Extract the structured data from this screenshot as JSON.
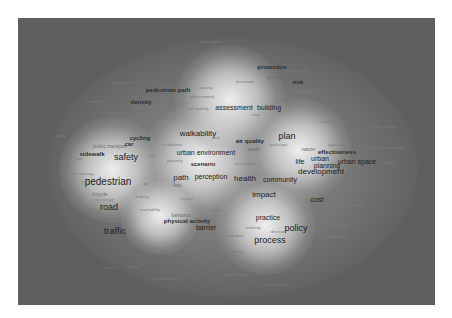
{
  "visualization": {
    "type": "term density map",
    "colors": {
      "background": "#ffffff",
      "low_density": "#5f5f5f",
      "high_density": "#f2f2f2",
      "text": "#222222"
    },
    "terms": [
      {
        "label": "urban growth",
        "x": 211,
        "y": 42,
        "size": 0
      },
      {
        "label": "protection",
        "x": 272,
        "y": 67,
        "size": 2
      },
      {
        "label": "exposure",
        "x": 298,
        "y": 71,
        "size": 0
      },
      {
        "label": "green infrastructure",
        "x": 289,
        "y": 77,
        "size": 1
      },
      {
        "label": "risk",
        "x": 298,
        "y": 82,
        "size": 2
      },
      {
        "label": "prevention",
        "x": 245,
        "y": 82,
        "size": 0
      },
      {
        "label": "mitigation",
        "x": 305,
        "y": 92,
        "size": 0
      },
      {
        "label": "disturbance",
        "x": 122,
        "y": 83,
        "size": 0
      },
      {
        "label": "land use",
        "x": 169,
        "y": 83,
        "size": 1
      },
      {
        "label": "pedestrian path",
        "x": 168,
        "y": 90,
        "size": 2
      },
      {
        "label": "capacity",
        "x": 205,
        "y": 88,
        "size": 0
      },
      {
        "label": "enhancement",
        "x": 202,
        "y": 97,
        "size": 0
      },
      {
        "label": "comfort",
        "x": 94,
        "y": 102,
        "size": 0
      },
      {
        "label": "density",
        "x": 141,
        "y": 102,
        "size": 2
      },
      {
        "label": "improvement",
        "x": 146,
        "y": 108,
        "size": 0
      },
      {
        "label": "soft mobility",
        "x": 198,
        "y": 109,
        "size": 0
      },
      {
        "label": "assessment",
        "x": 234,
        "y": 107,
        "size": 3
      },
      {
        "label": "building",
        "x": 269,
        "y": 107,
        "size": 3
      },
      {
        "label": "map",
        "x": 256,
        "y": 115,
        "size": 0
      },
      {
        "label": "active",
        "x": 114,
        "y": 113,
        "size": 0
      },
      {
        "label": "new york",
        "x": 130,
        "y": 118,
        "size": 0
      },
      {
        "label": "station",
        "x": 162,
        "y": 118,
        "size": 0
      },
      {
        "label": "vulnerability",
        "x": 330,
        "y": 122,
        "size": 0
      },
      {
        "label": "climate change",
        "x": 383,
        "y": 127,
        "size": 0
      },
      {
        "label": "quality",
        "x": 61,
        "y": 136,
        "size": 0
      },
      {
        "label": "walkability",
        "x": 198,
        "y": 134,
        "size": 4
      },
      {
        "label": "plan",
        "x": 287,
        "y": 136,
        "size": 5
      },
      {
        "label": "cycling",
        "x": 140,
        "y": 138,
        "size": 2
      },
      {
        "label": "public transport",
        "x": 110,
        "y": 146,
        "size": 1
      },
      {
        "label": "car",
        "x": 129,
        "y": 144,
        "size": 2
      },
      {
        "label": "park",
        "x": 216,
        "y": 138,
        "size": 0
      },
      {
        "label": "air quality",
        "x": 250,
        "y": 141,
        "size": 2
      },
      {
        "label": "landscape",
        "x": 278,
        "y": 145,
        "size": 0
      },
      {
        "label": "air pollution",
        "x": 172,
        "y": 145,
        "size": 0
      },
      {
        "label": "opportunity",
        "x": 338,
        "y": 145,
        "size": 0
      },
      {
        "label": "urban sustainability",
        "x": 387,
        "y": 148,
        "size": 0
      },
      {
        "label": "water",
        "x": 254,
        "y": 149,
        "size": 1
      },
      {
        "label": "nature",
        "x": 308,
        "y": 149,
        "size": 1
      },
      {
        "label": "effectiveness",
        "x": 337,
        "y": 152,
        "size": 2
      },
      {
        "label": "sidewalk",
        "x": 92,
        "y": 154,
        "size": 2
      },
      {
        "label": "safety",
        "x": 126,
        "y": 157,
        "size": 5
      },
      {
        "label": "bus",
        "x": 79,
        "y": 159,
        "size": 0
      },
      {
        "label": "trail",
        "x": 152,
        "y": 156,
        "size": 0
      },
      {
        "label": "urban environment",
        "x": 206,
        "y": 152,
        "size": 3
      },
      {
        "label": "urban",
        "x": 320,
        "y": 158,
        "size": 3
      },
      {
        "label": "proximity",
        "x": 175,
        "y": 161,
        "size": 0
      },
      {
        "label": "scenario",
        "x": 203,
        "y": 164,
        "size": 2
      },
      {
        "label": "accessibility",
        "x": 245,
        "y": 164,
        "size": 0
      },
      {
        "label": "life",
        "x": 300,
        "y": 161,
        "size": 3
      },
      {
        "label": "planning",
        "x": 327,
        "y": 165,
        "size": 3
      },
      {
        "label": "urban space",
        "x": 357,
        "y": 161,
        "size": 3
      },
      {
        "label": "resilience",
        "x": 388,
        "y": 163,
        "size": 0
      },
      {
        "label": "development",
        "x": 321,
        "y": 172,
        "size": 4
      },
      {
        "label": "pedestrian crossing",
        "x": 76,
        "y": 174,
        "size": 0
      },
      {
        "label": "path",
        "x": 181,
        "y": 178,
        "size": 4
      },
      {
        "label": "perception",
        "x": 211,
        "y": 176,
        "size": 3
      },
      {
        "label": "health",
        "x": 245,
        "y": 179,
        "size": 4
      },
      {
        "label": "community",
        "x": 280,
        "y": 179,
        "size": 3
      },
      {
        "label": "pedestrian",
        "x": 108,
        "y": 182,
        "size": 6
      },
      {
        "label": "risk",
        "x": 84,
        "y": 182,
        "size": 0
      },
      {
        "label": "dk",
        "x": 146,
        "y": 184,
        "size": 0
      },
      {
        "label": "flow",
        "x": 177,
        "y": 185,
        "size": 1
      },
      {
        "label": "bicycle",
        "x": 100,
        "y": 194,
        "size": 1
      },
      {
        "label": "streetscape",
        "x": 104,
        "y": 200,
        "size": 0
      },
      {
        "label": "walking",
        "x": 142,
        "y": 197,
        "size": 0
      },
      {
        "label": "impact",
        "x": 264,
        "y": 195,
        "size": 4
      },
      {
        "label": "respect",
        "x": 187,
        "y": 199,
        "size": 0
      },
      {
        "label": "cost",
        "x": 317,
        "y": 199,
        "size": 3
      },
      {
        "label": "road",
        "x": 109,
        "y": 207,
        "size": 5
      },
      {
        "label": "society",
        "x": 312,
        "y": 209,
        "size": 0
      },
      {
        "label": "demand",
        "x": 359,
        "y": 206,
        "size": 0
      },
      {
        "label": "reachability",
        "x": 150,
        "y": 210,
        "size": 0
      },
      {
        "label": "vitality",
        "x": 216,
        "y": 210,
        "size": 0
      },
      {
        "label": "behavior",
        "x": 181,
        "y": 215,
        "size": 1
      },
      {
        "label": "practice",
        "x": 268,
        "y": 217,
        "size": 3
      },
      {
        "label": "physical activity",
        "x": 187,
        "y": 221,
        "size": 2
      },
      {
        "label": "barrier",
        "x": 206,
        "y": 227,
        "size": 3
      },
      {
        "label": "technology",
        "x": 337,
        "y": 225,
        "size": 0
      },
      {
        "label": "traffic",
        "x": 115,
        "y": 231,
        "size": 5
      },
      {
        "label": "authority",
        "x": 253,
        "y": 228,
        "size": 0
      },
      {
        "label": "policy",
        "x": 296,
        "y": 228,
        "size": 5
      },
      {
        "label": "decision",
        "x": 278,
        "y": 232,
        "size": 0
      },
      {
        "label": "individual",
        "x": 235,
        "y": 236,
        "size": 0
      },
      {
        "label": "participation",
        "x": 337,
        "y": 237,
        "size": 0
      },
      {
        "label": "process",
        "x": 270,
        "y": 240,
        "size": 5
      },
      {
        "label": "length",
        "x": 151,
        "y": 248,
        "size": 0
      },
      {
        "label": "distance",
        "x": 193,
        "y": 249,
        "size": 0
      },
      {
        "label": "disability",
        "x": 236,
        "y": 252,
        "size": 0
      },
      {
        "label": "social",
        "x": 109,
        "y": 268,
        "size": 0
      },
      {
        "label": "activity",
        "x": 133,
        "y": 267,
        "size": 0
      },
      {
        "label": "questionnaire",
        "x": 237,
        "y": 275,
        "size": 0
      },
      {
        "label": "transformation",
        "x": 165,
        "y": 279,
        "size": 0
      },
      {
        "label": "human health",
        "x": 276,
        "y": 285,
        "size": 0
      }
    ],
    "density_peaks": [
      {
        "x": 112,
        "y": 170,
        "r": 48
      },
      {
        "x": 200,
        "y": 160,
        "r": 52
      },
      {
        "x": 300,
        "y": 150,
        "r": 46
      },
      {
        "x": 265,
        "y": 225,
        "r": 45
      },
      {
        "x": 230,
        "y": 100,
        "r": 50
      },
      {
        "x": 160,
        "y": 215,
        "r": 36
      }
    ]
  }
}
